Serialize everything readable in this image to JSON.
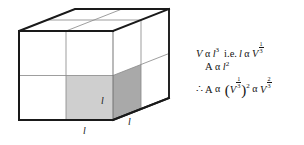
{
  "figure": {
    "type": "oblique-projection-cuboid",
    "colors": {
      "outline": "#1a1a1a",
      "interior_line": "#8d8d8d",
      "face_blank": "#ffffff",
      "shaded_front_cell": "#cfcfcf",
      "shaded_side_cell": "#a9a9a9",
      "background": "#ffffff",
      "text": "#141414"
    },
    "geometry": {
      "front_left_x": 19,
      "front_right_x": 113,
      "front_top_y": 31,
      "front_bottom_y": 120,
      "depth_dx": 56,
      "depth_dy": -22,
      "grid_cols": 2,
      "grid_rows": 2
    },
    "labels": [
      {
        "name": "length-label-front-cell",
        "text": "l",
        "x": 101,
        "y": 104
      },
      {
        "name": "length-label-bottom-edge",
        "text": "l",
        "x": 83,
        "y": 134
      },
      {
        "name": "length-label-depth-edge",
        "text": "l",
        "x": 128,
        "y": 125
      }
    ]
  },
  "equations": {
    "line1": {
      "volume_symbol": "V",
      "prop": "α",
      "length_symbol": "l",
      "length_power": "3",
      "connector": "i.e.",
      "length_symbol_2": "l",
      "prop_2": "α",
      "volume_symbol_2": "V",
      "exp_num": "1",
      "exp_den": "3",
      "plain": "V α l³  i.e. l α V^(1/3)"
    },
    "line2": {
      "area_symbol": "A",
      "prop": "α",
      "length_symbol": "l",
      "length_power": "2",
      "plain": "A α l²"
    },
    "line3": {
      "therefore": "∴",
      "area_symbol": "A",
      "prop": "α",
      "open_paren": "(",
      "volume_symbol": "V",
      "inner_exp_num": "1",
      "inner_exp_den": "3",
      "close_paren": ")",
      "outer_power": "2",
      "prop_2": "α",
      "volume_symbol_2": "V",
      "exp_num": "2",
      "exp_den": "3",
      "plain": "∴ A α (V^(1/3))² α V^(2/3)"
    }
  }
}
